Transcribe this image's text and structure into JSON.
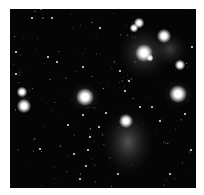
{
  "image": {
    "subject": "Star cluster with reflection nebulosity",
    "background_color": "#050505",
    "frame": {
      "left": 10,
      "top": 9,
      "width": 186,
      "height": 179,
      "border_color": "#ffffff"
    },
    "nebulae": [
      {
        "cx": 134,
        "cy": 44,
        "rx": 26,
        "ry": 26,
        "opacity": 0.35
      },
      {
        "cx": 160,
        "cy": 40,
        "rx": 18,
        "ry": 18,
        "opacity": 0.25
      },
      {
        "cx": 118,
        "cy": 133,
        "rx": 26,
        "ry": 34,
        "opacity": 0.35
      },
      {
        "cx": 75,
        "cy": 88,
        "rx": 16,
        "ry": 15,
        "opacity": 0.3
      },
      {
        "cx": 168,
        "cy": 85,
        "rx": 16,
        "ry": 14,
        "opacity": 0.25
      },
      {
        "cx": 14,
        "cy": 95,
        "rx": 8,
        "ry": 12,
        "opacity": 0.2
      }
    ],
    "bright_stars": [
      {
        "x": 134,
        "y": 44,
        "r": 5
      },
      {
        "x": 154,
        "y": 27,
        "r": 4
      },
      {
        "x": 129,
        "y": 14,
        "r": 3
      },
      {
        "x": 124,
        "y": 19,
        "r": 2.5
      },
      {
        "x": 168,
        "y": 85,
        "r": 5
      },
      {
        "x": 75,
        "y": 88,
        "r": 5
      },
      {
        "x": 14,
        "y": 97,
        "r": 4
      },
      {
        "x": 12,
        "y": 83,
        "r": 3
      },
      {
        "x": 116,
        "y": 112,
        "r": 4
      },
      {
        "x": 170,
        "y": 56,
        "r": 3
      },
      {
        "x": 140,
        "y": 49,
        "r": 2
      }
    ],
    "faint_stars": [
      [
        6,
        43
      ],
      [
        42,
        9
      ],
      [
        90,
        19
      ],
      [
        38,
        48
      ],
      [
        47,
        53
      ],
      [
        73,
        58
      ],
      [
        110,
        62
      ],
      [
        119,
        72
      ],
      [
        30,
        140
      ],
      [
        78,
        141
      ],
      [
        80,
        128
      ],
      [
        89,
        118
      ],
      [
        76,
        157
      ],
      [
        108,
        165
      ],
      [
        175,
        105
      ],
      [
        182,
        38
      ],
      [
        187,
        82
      ],
      [
        142,
        98
      ],
      [
        130,
        98
      ],
      [
        96,
        104
      ],
      [
        73,
        106
      ],
      [
        160,
        165
      ],
      [
        70,
        170
      ],
      [
        22,
        9
      ],
      [
        6,
        65
      ],
      [
        58,
        116
      ],
      [
        64,
        145
      ],
      [
        181,
        141
      ],
      [
        150,
        112
      ],
      [
        115,
        82
      ]
    ]
  }
}
